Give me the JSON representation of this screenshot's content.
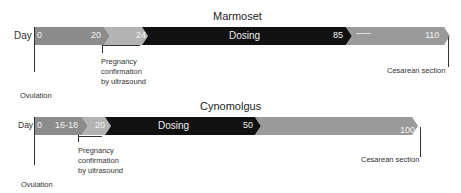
{
  "colors": {
    "phase_pre": "#8c8c8c",
    "phase_confirm": "#b3b3b3",
    "phase_dosing": "#111111",
    "phase_post": "#999999"
  },
  "marmoset": {
    "title": "Marmoset",
    "day_label": "Day",
    "markers": [
      "0",
      "20",
      "24",
      "85",
      "110"
    ],
    "dosing_label": "Dosing",
    "dash_label": "-------",
    "pregnancy_note": [
      "Pregnancy",
      "confirmation",
      "by ultrasound"
    ],
    "ovulation_label": "Ovulation",
    "cesarean_label": "Cesarean section"
  },
  "cynomolgus": {
    "title": "Cynomolgus",
    "day_label": "Day",
    "markers": [
      "0",
      "16-18",
      "20",
      "50",
      "100"
    ],
    "dosing_label": "Dosing",
    "pregnancy_note": [
      "Pregnancy",
      "confirmation",
      "by ultrasound"
    ],
    "ovulation_label": "Ovulation",
    "cesarean_label": "Cesarean section"
  }
}
